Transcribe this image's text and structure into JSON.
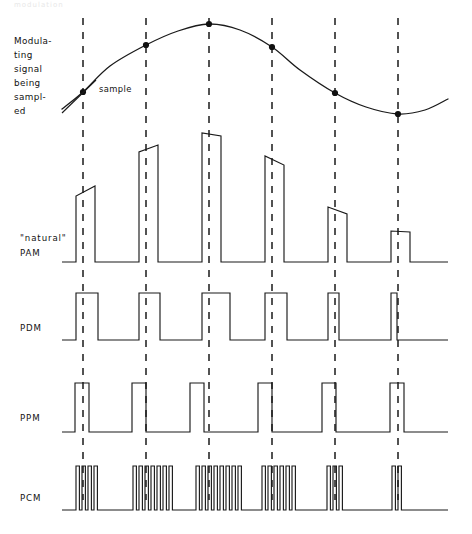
{
  "figure": {
    "faint_header": "modulation",
    "background_color": "#ffffff",
    "ink_color": "#1a1a1a"
  },
  "labels": {
    "modulating_signal": [
      "Modula-",
      "ting",
      "signal",
      "being",
      "sampl-",
      "ed"
    ],
    "sample_annotation": "sample",
    "pam": [
      "\"natural\"",
      "PAM"
    ],
    "pdm": "PDM",
    "ppm": "PPM",
    "pcm": "PCM"
  },
  "chart_data": {
    "type": "line",
    "xlabel": "",
    "ylabel": "",
    "grid": false,
    "legend": "none",
    "sample_count": 6,
    "sample_x": [
      83,
      146,
      209,
      272,
      335,
      398
    ],
    "carrier": {
      "name": "Modulating signal being sampled",
      "description": "One cycle of a sine-like modulating wave rising to a crest then falling to a trough",
      "x": [
        62,
        83,
        110,
        146,
        178,
        209,
        240,
        272,
        300,
        335,
        366,
        398,
        425,
        448
      ],
      "y": [
        109,
        92,
        66,
        45,
        31,
        24,
        30,
        47,
        70,
        93,
        107,
        114,
        110,
        99
      ],
      "ylim": [
        20,
        120
      ]
    },
    "samples": [
      {
        "index": 1,
        "x": 83,
        "y": 92,
        "amplitude": 0.34
      },
      {
        "index": 2,
        "x": 146,
        "y": 45,
        "amplitude": 0.78
      },
      {
        "index": 3,
        "x": 209,
        "y": 24,
        "amplitude": 1.0
      },
      {
        "index": 4,
        "x": 272,
        "y": 47,
        "amplitude": 0.75
      },
      {
        "index": 5,
        "x": 335,
        "y": 93,
        "amplitude": 0.31
      },
      {
        "index": 6,
        "x": 398,
        "y": 114,
        "amplitude": 0.14
      }
    ],
    "series": [
      {
        "name": "\"natural\" PAM",
        "encodes": "amplitude",
        "baseline_y": 262,
        "pulses": [
          {
            "x_start": 76,
            "x_end": 95,
            "top_left": 196,
            "top_right": 186
          },
          {
            "x_start": 139,
            "x_end": 158,
            "top_left": 152,
            "top_right": 145
          },
          {
            "x_start": 202,
            "x_end": 221,
            "top_left": 133,
            "top_right": 136
          },
          {
            "x_start": 265,
            "x_end": 284,
            "top_left": 156,
            "top_right": 165
          },
          {
            "x_start": 328,
            "x_end": 347,
            "top_left": 207,
            "top_right": 214
          },
          {
            "x_start": 391,
            "x_end": 410,
            "top_left": 231,
            "top_right": 232
          }
        ]
      },
      {
        "name": "PDM",
        "encodes": "pulse duration (width)",
        "baseline_y": 340,
        "amplitude_y": 293,
        "pulses": [
          {
            "x_start": 76,
            "x_end": 98
          },
          {
            "x_start": 139,
            "x_end": 160
          },
          {
            "x_start": 202,
            "x_end": 230
          },
          {
            "x_start": 265,
            "x_end": 287
          },
          {
            "x_start": 328,
            "x_end": 339
          },
          {
            "x_start": 391,
            "x_end": 397
          }
        ]
      },
      {
        "name": "PPM",
        "encodes": "pulse position (time shift)",
        "baseline_y": 432,
        "amplitude_y": 383,
        "pulses": [
          {
            "x_start": 75,
            "x_end": 89
          },
          {
            "x_start": 132,
            "x_end": 146
          },
          {
            "x_start": 190,
            "x_end": 204
          },
          {
            "x_start": 258,
            "x_end": 272
          },
          {
            "x_start": 322,
            "x_end": 336
          },
          {
            "x_start": 390,
            "x_end": 404
          }
        ]
      },
      {
        "name": "PCM",
        "encodes": "binary coded pulse groups",
        "baseline_y": 510,
        "amplitude_y": 466,
        "groups": [
          {
            "sample": 1,
            "pulse_count": 4,
            "x_start": 76,
            "pulse_width": 3.4,
            "pulse_gap": 2.6
          },
          {
            "sample": 2,
            "pulse_count": 7,
            "x_start": 133,
            "pulse_width": 3.4,
            "pulse_gap": 2.6
          },
          {
            "sample": 3,
            "pulse_count": 8,
            "x_start": 196,
            "pulse_width": 3.4,
            "pulse_gap": 2.6
          },
          {
            "sample": 4,
            "pulse_count": 6,
            "x_start": 262,
            "pulse_width": 3.4,
            "pulse_gap": 2.6
          },
          {
            "sample": 5,
            "pulse_count": 3,
            "x_start": 327,
            "pulse_width": 3.4,
            "pulse_gap": 2.6
          },
          {
            "sample": 6,
            "pulse_count": 2,
            "x_start": 392,
            "pulse_width": 3.4,
            "pulse_gap": 2.6
          }
        ]
      }
    ],
    "dashed_guides": {
      "x_positions": [
        83,
        146,
        209,
        272,
        335,
        398
      ],
      "y_top": 18,
      "y_bottom": 500,
      "style": "dashed"
    }
  }
}
